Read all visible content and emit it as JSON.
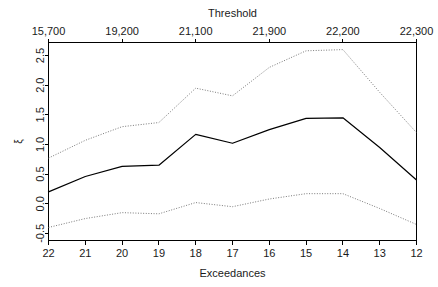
{
  "figure": {
    "top_axis_title": "Threshold",
    "bottom_axis_title": "Exceedances",
    "y_axis_title": "ξ"
  },
  "chart_data": {
    "type": "line",
    "title": "Threshold",
    "xlabel": "Exceedances",
    "ylabel": "ξ",
    "grid": false,
    "legend": "none",
    "xlim": [
      22,
      12
    ],
    "ylim": [
      -0.62,
      2.72
    ],
    "x_axis_direction": "decreasing",
    "x": [
      22,
      21,
      20,
      19,
      18,
      17,
      16,
      15,
      14,
      13,
      12
    ],
    "x_tick_labels": [
      "22",
      "21",
      "20",
      "19",
      "18",
      "17",
      "16",
      "15",
      "14",
      "13",
      "12"
    ],
    "y_tick_values": [
      -0.5,
      0.0,
      0.5,
      1.0,
      1.5,
      2.0,
      2.5
    ],
    "y_tick_labels": [
      "-0.5",
      "0.0",
      "0.5",
      "1.0",
      "1.5",
      "2.0",
      "2.5"
    ],
    "top_axis": {
      "label": "Threshold",
      "tick_x": [
        22,
        20,
        18,
        16,
        14,
        12
      ],
      "tick_labels": [
        "15,700",
        "19,200",
        "21,100",
        "21,900",
        "22,200",
        "22,300"
      ]
    },
    "series": [
      {
        "name": "Shape parameter estimate",
        "style": "solid",
        "color": "#000000",
        "values": [
          0.2,
          0.46,
          0.63,
          0.65,
          1.17,
          1.02,
          1.25,
          1.44,
          1.45,
          0.95,
          0.4
        ]
      },
      {
        "name": "Upper 95% confidence limit",
        "style": "dotted",
        "color": "#7a7a7a",
        "values": [
          0.77,
          1.07,
          1.3,
          1.37,
          1.95,
          1.82,
          2.3,
          2.58,
          2.6,
          1.88,
          1.2
        ]
      },
      {
        "name": "Lower 95% confidence limit",
        "style": "dotted",
        "color": "#7a7a7a",
        "values": [
          -0.4,
          -0.25,
          -0.15,
          -0.17,
          0.02,
          -0.05,
          0.08,
          0.17,
          0.17,
          -0.08,
          -0.35
        ]
      }
    ]
  }
}
